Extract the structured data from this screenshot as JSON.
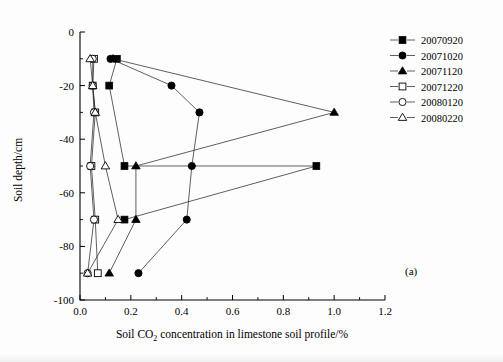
{
  "figure": {
    "panel_label": "(a)",
    "xlabel_pre": "Soil CO",
    "xlabel_sub": "2",
    "xlabel_post": " concentration in limestone soil profile/%",
    "ylabel": "Soil depth/cm"
  },
  "legend": {
    "position": "top-right",
    "items": [
      {
        "label": "20070920",
        "marker": "filled-square"
      },
      {
        "label": "20071020",
        "marker": "filled-circle"
      },
      {
        "label": "20071120",
        "marker": "filled-triangle"
      },
      {
        "label": "20071220",
        "marker": "open-square"
      },
      {
        "label": "20080120",
        "marker": "open-circle"
      },
      {
        "label": "20080220",
        "marker": "open-triangle"
      }
    ]
  },
  "chart_data": {
    "type": "line",
    "title": "",
    "xlabel": "Soil CO2 concentration in limestone soil profile/%",
    "ylabel": "Soil depth/cm",
    "xlim": [
      0.0,
      1.2
    ],
    "ylim": [
      -100,
      0
    ],
    "xticks": [
      "0.0",
      "0.2",
      "0.4",
      "0.6",
      "0.8",
      "1.0",
      "1.2"
    ],
    "xtick_values": [
      0.0,
      0.2,
      0.4,
      0.6,
      0.8,
      1.0,
      1.2
    ],
    "yticks": [
      "0",
      "-20",
      "-40",
      "-60",
      "-80",
      "-100"
    ],
    "ytick_values": [
      0,
      -20,
      -40,
      -60,
      -80,
      -100
    ],
    "grid": false,
    "legend_position": "top-right",
    "orientation": "x=concentration, y=depth",
    "series": [
      {
        "name": "20070920",
        "marker": "filled-square",
        "x": [
          0.145,
          0.115,
          0.175,
          0.93,
          0.175
        ],
        "y": [
          -10,
          -20,
          -50,
          -50,
          -70
        ]
      },
      {
        "name": "20071020",
        "marker": "filled-circle",
        "x": [
          0.12,
          0.36,
          0.47,
          0.44,
          0.42,
          0.23
        ],
        "y": [
          -10,
          -20,
          -30,
          -50,
          -70,
          -90
        ]
      },
      {
        "name": "20071120",
        "marker": "filled-triangle",
        "x": [
          0.13,
          1.0,
          0.22,
          0.22,
          0.115
        ],
        "y": [
          -10,
          -30,
          -50,
          -70,
          -90
        ]
      },
      {
        "name": "20071220",
        "marker": "open-square",
        "x": [
          0.055,
          0.05,
          0.06,
          0.045,
          0.06,
          0.07
        ],
        "y": [
          -10,
          -20,
          -30,
          -50,
          -70,
          -90
        ]
      },
      {
        "name": "20080120",
        "marker": "open-circle",
        "x": [
          0.05,
          0.05,
          0.055,
          0.04,
          0.055,
          0.03
        ],
        "y": [
          -10,
          -20,
          -30,
          -50,
          -70,
          -90
        ]
      },
      {
        "name": "20080220",
        "marker": "open-triangle",
        "x": [
          0.04,
          0.05,
          0.06,
          0.1,
          0.15,
          0.03
        ],
        "y": [
          -10,
          -20,
          -30,
          -50,
          -70,
          -90
        ]
      }
    ]
  }
}
